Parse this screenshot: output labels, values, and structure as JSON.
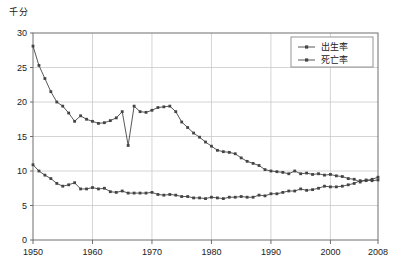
{
  "chart_data": {
    "type": "line",
    "title": "",
    "unit_label": "千分",
    "xlabel": "",
    "ylabel": "",
    "xlim": [
      1950,
      2008
    ],
    "ylim": [
      0,
      30
    ],
    "grid": true,
    "legend_position": "top-right",
    "yticks": [
      0,
      5,
      10,
      15,
      20,
      25,
      30
    ],
    "ytick_labels": [
      "0",
      "5",
      "10",
      "15",
      "20",
      "25",
      "30"
    ],
    "xticks": [
      1950,
      1960,
      1970,
      1980,
      1990,
      2000,
      2008
    ],
    "xtick_labels": [
      "1950",
      "1960",
      "1970",
      "1980",
      "1990",
      "2000",
      "2008"
    ],
    "series": [
      {
        "name": "出生率",
        "color": "#444444",
        "marker": "square",
        "x": [
          1950,
          1951,
          1952,
          1953,
          1954,
          1955,
          1956,
          1957,
          1958,
          1959,
          1960,
          1961,
          1962,
          1963,
          1964,
          1965,
          1966,
          1967,
          1968,
          1969,
          1970,
          1971,
          1972,
          1973,
          1974,
          1975,
          1976,
          1977,
          1978,
          1979,
          1980,
          1981,
          1982,
          1983,
          1984,
          1985,
          1986,
          1987,
          1988,
          1989,
          1990,
          1991,
          1992,
          1993,
          1994,
          1995,
          1996,
          1997,
          1998,
          1999,
          2000,
          2001,
          2002,
          2003,
          2004,
          2005,
          2006,
          2007,
          2008
        ],
        "values": [
          28.1,
          25.3,
          23.4,
          21.5,
          20.0,
          19.4,
          18.4,
          17.2,
          18.0,
          17.5,
          17.2,
          16.9,
          17.0,
          17.3,
          17.7,
          18.6,
          13.7,
          19.4,
          18.6,
          18.5,
          18.8,
          19.2,
          19.3,
          19.4,
          18.6,
          17.1,
          16.3,
          15.5,
          14.9,
          14.2,
          13.6,
          13.0,
          12.8,
          12.7,
          12.5,
          11.9,
          11.4,
          11.1,
          10.8,
          10.2,
          10.0,
          9.9,
          9.8,
          9.6,
          10.0,
          9.6,
          9.7,
          9.5,
          9.6,
          9.4,
          9.5,
          9.3,
          9.2,
          8.9,
          8.8,
          8.4,
          8.7,
          8.6,
          8.7
        ]
      },
      {
        "name": "死亡率",
        "color": "#444444",
        "marker": "square",
        "x": [
          1950,
          1951,
          1952,
          1953,
          1954,
          1955,
          1956,
          1957,
          1958,
          1959,
          1960,
          1961,
          1962,
          1963,
          1964,
          1965,
          1966,
          1967,
          1968,
          1969,
          1970,
          1971,
          1972,
          1973,
          1974,
          1975,
          1976,
          1977,
          1978,
          1979,
          1980,
          1981,
          1982,
          1983,
          1984,
          1985,
          1986,
          1987,
          1988,
          1989,
          1990,
          1991,
          1992,
          1993,
          1994,
          1995,
          1996,
          1997,
          1998,
          1999,
          2000,
          2001,
          2002,
          2003,
          2004,
          2005,
          2006,
          2007,
          2008
        ],
        "values": [
          10.9,
          10.0,
          9.4,
          8.9,
          8.2,
          7.8,
          8.0,
          8.3,
          7.4,
          7.4,
          7.6,
          7.4,
          7.5,
          7.0,
          6.9,
          7.1,
          6.8,
          6.8,
          6.8,
          6.8,
          6.9,
          6.6,
          6.5,
          6.6,
          6.5,
          6.3,
          6.3,
          6.1,
          6.1,
          6.0,
          6.2,
          6.1,
          6.0,
          6.2,
          6.2,
          6.3,
          6.2,
          6.2,
          6.5,
          6.4,
          6.7,
          6.7,
          6.9,
          7.1,
          7.1,
          7.4,
          7.2,
          7.3,
          7.5,
          7.8,
          7.7,
          7.7,
          7.8,
          8.0,
          8.2,
          8.6,
          8.6,
          8.8,
          9.1
        ]
      }
    ]
  },
  "legend": {
    "items": [
      {
        "label": "出生率"
      },
      {
        "label": "死亡率"
      }
    ]
  }
}
